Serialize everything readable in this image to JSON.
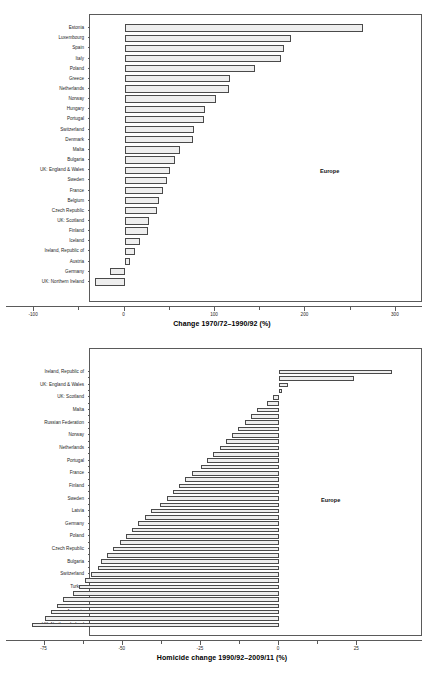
{
  "chart_data": [
    {
      "type": "bar",
      "orientation": "horizontal",
      "title": "",
      "xlabel": "Change 1970/72–1990/92 (%)",
      "ylabel": "",
      "annotation": "Europe",
      "xlim": [
        -130,
        330
      ],
      "xticks": [
        -100,
        0,
        100,
        200,
        300
      ],
      "xticklabels": [
        "-100",
        "0",
        "100",
        "200",
        "300"
      ],
      "grid": false,
      "legend": "none",
      "categories": [
        "Estonia",
        "Luxembourg",
        "Spain",
        "Italy",
        "Poland",
        "Greece",
        "Netherlands",
        "Norway",
        "Hungary",
        "Portugal",
        "Switzerland",
        "Denmark",
        "Malta",
        "Bulgaria",
        "UK: England & Wales",
        "Sweden",
        "France",
        "Belgium",
        "Czech Republic",
        "UK: Scotland",
        "Finland",
        "Iceland",
        "Ireland, Republic of",
        "Austria",
        "Germany",
        "UK: Northern Ireland"
      ],
      "values": [
        264,
        184,
        176,
        173,
        144,
        117,
        115,
        101,
        89,
        88,
        77,
        76,
        61,
        56,
        50,
        47,
        42,
        38,
        36,
        27,
        26,
        17,
        11,
        6,
        -16,
        -33
      ]
    },
    {
      "type": "bar",
      "orientation": "horizontal",
      "title": "",
      "xlabel": "Homicide change 1990/92–2009/11 (%)",
      "ylabel": "",
      "annotation": "Europe",
      "xlim": [
        -87,
        46
      ],
      "xticks": [
        -75,
        -50,
        -25,
        0,
        25
      ],
      "xticklabels": [
        "-75",
        "-50",
        "-25",
        "0",
        "25"
      ],
      "grid": false,
      "legend": "none",
      "categories": [
        "Ireland, Republic of",
        "",
        "UK: England & Wales",
        "",
        "UK: Scotland",
        "",
        "Malta",
        "",
        "Russian Federation",
        "",
        "Norway",
        "",
        "Netherlands",
        "",
        "Portugal",
        "",
        "France",
        "",
        "Finland",
        "",
        "Sweden",
        "",
        "Latvia",
        "",
        "Germany",
        "",
        "Poland",
        "",
        "Czech Republic",
        "",
        "Bulgaria",
        "",
        "Switzerland",
        "",
        "Turkey",
        "",
        "Georgia",
        "",
        "Armenia",
        "",
        "UK: Northern Ireland"
      ],
      "values": [
        36,
        24,
        3,
        1,
        -2,
        -4,
        -7,
        -9,
        -11,
        -13,
        -15,
        -17,
        -19,
        -21,
        -23,
        -25,
        -28,
        -30,
        -32,
        -34,
        -36,
        -38,
        -41,
        -43,
        -45,
        -47,
        -49,
        -51,
        -53,
        -55,
        -57,
        -58,
        -60,
        -62,
        -64,
        -66,
        -69,
        -71,
        -73,
        -75,
        -79
      ]
    }
  ]
}
